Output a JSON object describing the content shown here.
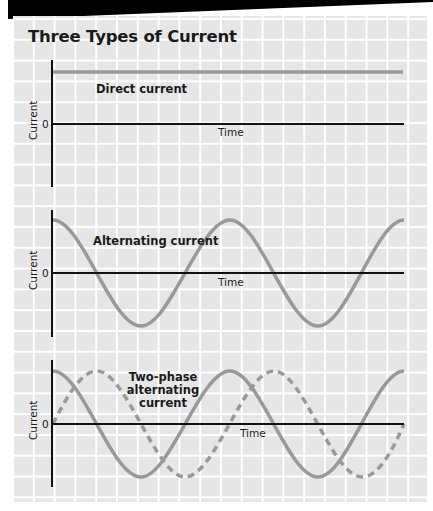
{
  "title": "Three Types of Current",
  "colors": {
    "grid_background": "#e6e6e6",
    "grid_lines": "#ffffff",
    "axis": "#111111",
    "waveform": "#999999",
    "top_band": "#000000"
  },
  "panels": [
    {
      "label": "Direct current",
      "y_axis_label": "Current",
      "zero_label": "0",
      "x_axis_label": "Time",
      "waveform": "constant positive"
    },
    {
      "label": "Alternating current",
      "y_axis_label": "Current",
      "zero_label": "0",
      "x_axis_label": "Time",
      "waveform": "cosine, ~2 cycles"
    },
    {
      "label_lines": [
        "Two-phase",
        "alternating",
        "current"
      ],
      "y_axis_label": "Current",
      "zero_label": "0",
      "x_axis_label": "Time",
      "waveform": "cosine (solid) + sine 90° shifted (dashed)"
    }
  ]
}
